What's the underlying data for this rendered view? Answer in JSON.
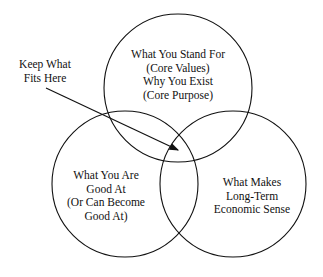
{
  "diagram": {
    "type": "venn",
    "circles": [
      {
        "id": "top",
        "lines": [
          "What You Stand For",
          "(Core Values)",
          "Why You Exist",
          "(Core Purpose)"
        ]
      },
      {
        "id": "left",
        "lines": [
          "What You Are",
          "Good At",
          "(Or Can Become",
          "Good At)"
        ]
      },
      {
        "id": "right",
        "lines": [
          "What Makes",
          "Long-Term",
          "Economic Sense"
        ]
      }
    ],
    "annotation": {
      "lines": [
        "Keep What",
        "Fits Here"
      ],
      "points_to": "intersection of all three circles"
    }
  }
}
